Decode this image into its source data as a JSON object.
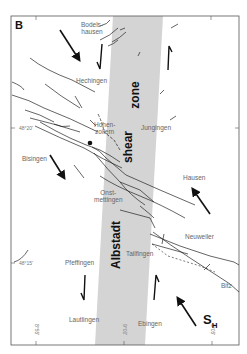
{
  "panel_label": "B",
  "shear_zone_labels": {
    "top": "shear",
    "top2": "zone",
    "bottom": "Albstadt"
  },
  "towns": [
    {
      "name": "bodelshausen",
      "text1": "Bodels-",
      "text2": "hausen"
    },
    {
      "name": "hechingen",
      "text": "Hechingen"
    },
    {
      "name": "hohenzollern",
      "text1": "Hohen-",
      "text2": "zollern"
    },
    {
      "name": "jungingen",
      "text": "Jungingen"
    },
    {
      "name": "bisingen",
      "text": "Bisingen"
    },
    {
      "name": "hausen",
      "text": "Hausen"
    },
    {
      "name": "onstmettingen",
      "text1": "Onst-",
      "text2": "mettingen"
    },
    {
      "name": "neuweiler",
      "text": "Neuweiler"
    },
    {
      "name": "tailfingen",
      "text": "Tailfingen"
    },
    {
      "name": "pfeffingen",
      "text": "Pfeffingen"
    },
    {
      "name": "bitz",
      "text": "Bitz"
    },
    {
      "name": "lautlingen",
      "text": "Lautlingen"
    },
    {
      "name": "ebingen",
      "text": "Ebingen"
    }
  ],
  "latitudes": [
    "48°20'",
    "48°15'"
  ],
  "longitudes": [
    "8°55'",
    "9°00'",
    "9°05'"
  ],
  "stress_label": {
    "main": "S",
    "sub": "H"
  },
  "fault_throws": [
    "100",
    "115",
    "115",
    "115",
    "75",
    "50",
    "30",
    "70",
    "80",
    "35",
    "40",
    "90",
    "50",
    "40",
    "95",
    "80"
  ],
  "colors": {
    "shear_band": "#d4d4d4",
    "frame": "#555555",
    "lines": "#222222",
    "labels": "#666666"
  }
}
